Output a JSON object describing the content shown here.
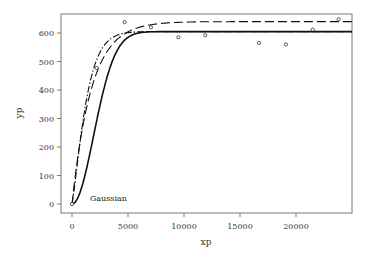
{
  "chart_data": {
    "type": "scatter",
    "title": "",
    "xlabel": "xp",
    "ylabel": "yp",
    "xlim": [
      -1000,
      25000
    ],
    "ylim": [
      -25,
      665
    ],
    "grid": false,
    "x_ticks": [
      0,
      5000,
      10000,
      15000,
      20000
    ],
    "x_tick_labels": [
      "0",
      "5000",
      "10000",
      "15000",
      "20000"
    ],
    "y_ticks": [
      0,
      100,
      200,
      300,
      400,
      500,
      600
    ],
    "y_tick_labels": [
      "0",
      "100",
      "200",
      "300",
      "400",
      "500",
      "600"
    ],
    "annotations": [
      {
        "text": "Gaussian",
        "x": 1600,
        "y": 10
      }
    ],
    "points": {
      "name": "observed",
      "marker": "open-circle",
      "x": [
        0,
        2200,
        4700,
        7050,
        9500,
        11900,
        16700,
        19100,
        21500,
        23800
      ],
      "y": [
        0,
        477,
        638,
        620,
        585,
        592,
        565,
        560,
        612,
        648
      ]
    },
    "series": [
      {
        "name": "Gaussian model",
        "style": "solid",
        "model": "gaussian",
        "asymptote": 605,
        "range": 4700
      },
      {
        "name": "spherical/other model",
        "style": "dash-dot",
        "model": "exponential-sill-fast",
        "asymptote": 605,
        "range": 3300
      },
      {
        "name": "exponential model",
        "style": "long-dash",
        "model": "exponential",
        "asymptote": 640,
        "range": 5200
      }
    ]
  }
}
